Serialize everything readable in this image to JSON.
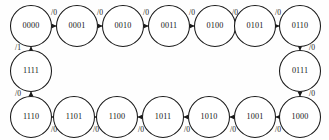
{
  "diagram": {
    "type": "finite-state-machine",
    "background_color": "#fefefe",
    "stroke_color": "#1a1a1a",
    "node_fill": "#ffffff",
    "node_radius": 20.5,
    "states": [
      {
        "id": "s0",
        "label": "0000",
        "cx": 31,
        "cy": 26,
        "row": "top"
      },
      {
        "id": "s1",
        "label": "0001",
        "cx": 77,
        "cy": 26,
        "row": "top"
      },
      {
        "id": "s2",
        "label": "0010",
        "cx": 123,
        "cy": 26,
        "row": "top"
      },
      {
        "id": "s3",
        "label": "0011",
        "cx": 169,
        "cy": 26,
        "row": "top"
      },
      {
        "id": "s4",
        "label": "0100",
        "cx": 215,
        "cy": 26,
        "row": "top"
      },
      {
        "id": "s5",
        "label": "0101",
        "cx": 255,
        "cy": 26,
        "row": "top"
      },
      {
        "id": "s6",
        "label": "0110",
        "cx": 300,
        "cy": 26,
        "row": "top-right"
      },
      {
        "id": "s7",
        "label": "0111",
        "cx": 300,
        "cy": 71,
        "row": "right"
      },
      {
        "id": "s8",
        "label": "1000",
        "cx": 300,
        "cy": 117,
        "row": "bottom-right"
      },
      {
        "id": "s9",
        "label": "1001",
        "cx": 255,
        "cy": 117,
        "row": "bottom"
      },
      {
        "id": "s10",
        "label": "1010",
        "cx": 209,
        "cy": 117,
        "row": "bottom"
      },
      {
        "id": "s11",
        "label": "1011",
        "cx": 163,
        "cy": 117,
        "row": "bottom"
      },
      {
        "id": "s12",
        "label": "1100",
        "cx": 117,
        "cy": 117,
        "row": "bottom"
      },
      {
        "id": "s13",
        "label": "1101",
        "cx": 74,
        "cy": 117,
        "row": "bottom"
      },
      {
        "id": "s14",
        "label": "1110",
        "cx": 31,
        "cy": 117,
        "row": "bottom-left"
      },
      {
        "id": "s15",
        "label": "1111",
        "cx": 31,
        "cy": 71,
        "row": "left"
      }
    ],
    "transitions": [
      {
        "from": "s0",
        "to": "s1",
        "output": "/0",
        "label_x": 54,
        "label_y": 13,
        "direction": "right"
      },
      {
        "from": "s1",
        "to": "s2",
        "output": "/0",
        "label_x": 100,
        "label_y": 13,
        "direction": "right"
      },
      {
        "from": "s2",
        "to": "s3",
        "output": "/0",
        "label_x": 146,
        "label_y": 13,
        "direction": "right"
      },
      {
        "from": "s3",
        "to": "s4",
        "output": "/0",
        "label_x": 192,
        "label_y": 13,
        "direction": "right"
      },
      {
        "from": "s4",
        "to": "s5",
        "output": "/0",
        "label_x": 235,
        "label_y": 13,
        "direction": "right"
      },
      {
        "from": "s5",
        "to": "s6",
        "output": "/0",
        "label_x": 278,
        "label_y": 13,
        "direction": "right"
      },
      {
        "from": "s6",
        "to": "s7",
        "output": "/0",
        "label_x": 312,
        "label_y": 48,
        "direction": "down"
      },
      {
        "from": "s7",
        "to": "s8",
        "output": "/0",
        "label_x": 312,
        "label_y": 94,
        "direction": "down"
      },
      {
        "from": "s8",
        "to": "s9",
        "output": "/0",
        "label_x": 278,
        "label_y": 130,
        "direction": "left"
      },
      {
        "from": "s9",
        "to": "s10",
        "output": "/0",
        "label_x": 233,
        "label_y": 130,
        "direction": "left"
      },
      {
        "from": "s10",
        "to": "s11",
        "output": "/0",
        "label_x": 187,
        "label_y": 130,
        "direction": "left"
      },
      {
        "from": "s11",
        "to": "s12",
        "output": "/0",
        "label_x": 141,
        "label_y": 130,
        "direction": "left"
      },
      {
        "from": "s12",
        "to": "s13",
        "output": "/0",
        "label_x": 96,
        "label_y": 130,
        "direction": "left"
      },
      {
        "from": "s13",
        "to": "s14",
        "output": "/0",
        "label_x": 54,
        "label_y": 130,
        "direction": "left"
      },
      {
        "from": "s14",
        "to": "s15",
        "output": "/0",
        "label_x": 18,
        "label_y": 94,
        "direction": "up"
      },
      {
        "from": "s15",
        "to": "s0",
        "output": "/1",
        "label_x": 18,
        "label_y": 48,
        "direction": "up"
      }
    ]
  }
}
